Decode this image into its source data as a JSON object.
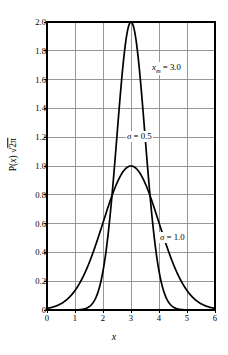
{
  "chart_data": {
    "type": "line",
    "title": "",
    "xlabel": "x",
    "ylabel": "P(x) √2π",
    "xlim": [
      0,
      6
    ],
    "ylim": [
      0,
      2.0
    ],
    "grid": true,
    "legend_position": "inline-annotation",
    "x_ticks": [
      "0",
      "1",
      "2",
      "3",
      "4",
      "5",
      "6"
    ],
    "x_tick_values": [
      0,
      1,
      2,
      3,
      4,
      5,
      6
    ],
    "y_ticks": [
      "0",
      "0.2",
      "0.4",
      "0.6",
      "0.8",
      "1.0",
      "1.2",
      "1.4",
      "1.6",
      "1.8",
      "2.0"
    ],
    "y_tick_values": [
      0,
      0.2,
      0.4,
      0.6,
      0.8,
      1.0,
      1.2,
      1.4,
      1.6,
      1.8,
      2.0
    ],
    "annotations": [
      {
        "id": "xm",
        "text": "xₘ = 3.0",
        "lead": "x",
        "sub": "m",
        "tail": " = 3.0",
        "x": 4.4,
        "y": 1.68
      },
      {
        "id": "sigma05",
        "text": "σ = 0.5",
        "sym": "σ",
        "tail": " = 0.5",
        "x": 3.6,
        "y": 1.25
      },
      {
        "id": "sigma10",
        "text": "σ = 1.0",
        "sym": "σ",
        "tail": " = 1.0",
        "x": 4.7,
        "y": 0.44
      }
    ],
    "curve_color": "#000000",
    "grid_color": "#8c8c8c",
    "axis_color": "#000000",
    "background_color": "#ffffff",
    "series": [
      {
        "name": "σ = 0.5",
        "sigma": 0.5,
        "mean": 3.0,
        "peak_value": 2.0,
        "formula": "exp(-(x-3)^2 / (2*0.5^2)) / 0.5",
        "x": [
          0.0,
          0.25,
          0.5,
          0.75,
          1.0,
          1.1,
          1.2,
          1.3,
          1.4,
          1.5,
          1.6,
          1.7,
          1.8,
          1.9,
          2.0,
          2.1,
          2.2,
          2.3,
          2.4,
          2.5,
          2.6,
          2.7,
          2.8,
          2.9,
          3.0,
          3.1,
          3.2,
          3.3,
          3.4,
          3.5,
          3.6,
          3.7,
          3.8,
          3.9,
          4.0,
          4.1,
          4.2,
          4.3,
          4.4,
          4.5,
          4.6,
          4.7,
          4.8,
          4.9,
          5.0,
          5.25,
          5.5,
          5.75,
          6.0
        ],
        "y": [
          0.0,
          0.0,
          0.0,
          0.0,
          0.001,
          0.002,
          0.005,
          0.011,
          0.022,
          0.044,
          0.082,
          0.145,
          0.243,
          0.387,
          0.587,
          0.843,
          1.148,
          1.479,
          1.797,
          2.0,
          1.797,
          1.479,
          1.148,
          0.843,
          2.0,
          2.0,
          1.797,
          1.479,
          1.148,
          0.843,
          0.587,
          0.387,
          0.243,
          0.145,
          0.082,
          0.044,
          0.022,
          0.011,
          0.005,
          0.002,
          0.001,
          0.0,
          0.0,
          0.0,
          0.0,
          0.0,
          0.0,
          0.0,
          0.0
        ]
      },
      {
        "name": "σ = 1.0",
        "sigma": 1.0,
        "mean": 3.0,
        "peak_value": 1.0,
        "formula": "exp(-(x-3)^2 / 2)",
        "x": [
          0.0,
          0.25,
          0.5,
          0.75,
          1.0,
          1.25,
          1.5,
          1.75,
          2.0,
          2.25,
          2.5,
          2.75,
          3.0,
          3.25,
          3.5,
          3.75,
          4.0,
          4.25,
          4.5,
          4.75,
          5.0,
          5.25,
          5.5,
          5.75,
          6.0
        ],
        "y": [
          0.011,
          0.021,
          0.044,
          0.08,
          0.135,
          0.211,
          0.325,
          0.456,
          0.607,
          0.754,
          0.882,
          0.969,
          1.0,
          0.969,
          0.882,
          0.754,
          0.607,
          0.456,
          0.325,
          0.211,
          0.135,
          0.08,
          0.044,
          0.021,
          0.011
        ]
      }
    ]
  }
}
